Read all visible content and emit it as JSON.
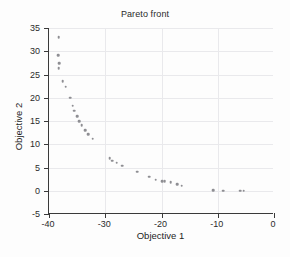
{
  "chart_data": {
    "type": "scatter",
    "title": "Pareto front",
    "xlabel": "Objective 1",
    "ylabel": "Objective 2",
    "xlim": [
      -40,
      0
    ],
    "ylim": [
      -5,
      35
    ],
    "xticks": [
      -40,
      -30,
      -20,
      -10,
      0
    ],
    "yticks": [
      -5,
      0,
      5,
      10,
      15,
      20,
      25,
      30,
      35
    ],
    "xtick_labels": [
      "-40",
      "-30",
      "-20",
      "-10",
      "0"
    ],
    "ytick_labels": [
      "-5",
      "0",
      "5",
      "10",
      "15",
      "20",
      "25",
      "30",
      "35"
    ],
    "grid": true,
    "legend": null,
    "marker": {
      "shape": "dot",
      "color": "#8e8e93",
      "size": 2.6
    },
    "series": [
      {
        "name": "Pareto front",
        "points": [
          [
            -38.3,
            33.0
          ],
          [
            -38.4,
            29.2
          ],
          [
            -38.2,
            27.4
          ],
          [
            -38.3,
            26.3
          ],
          [
            -37.6,
            23.6
          ],
          [
            -37.0,
            22.4
          ],
          [
            -36.2,
            20.0
          ],
          [
            -35.8,
            18.3
          ],
          [
            -35.5,
            17.2
          ],
          [
            -35.0,
            16.0
          ],
          [
            -34.6,
            15.0
          ],
          [
            -34.2,
            14.1
          ],
          [
            -33.6,
            13.0
          ],
          [
            -33.0,
            12.2
          ],
          [
            -32.2,
            11.2
          ],
          [
            -29.2,
            7.0
          ],
          [
            -28.8,
            6.5
          ],
          [
            -28.0,
            6.0
          ],
          [
            -27.0,
            5.4
          ],
          [
            -24.3,
            4.1
          ],
          [
            -22.2,
            3.0
          ],
          [
            -21.0,
            2.4
          ],
          [
            -19.9,
            2.1
          ],
          [
            -19.4,
            2.1
          ],
          [
            -18.4,
            1.8
          ],
          [
            -17.2,
            1.4
          ],
          [
            -16.4,
            1.1
          ],
          [
            -10.8,
            0.1
          ],
          [
            -9.0,
            0.0
          ],
          [
            -6.0,
            0.0
          ],
          [
            -5.4,
            0.0
          ]
        ]
      }
    ]
  }
}
